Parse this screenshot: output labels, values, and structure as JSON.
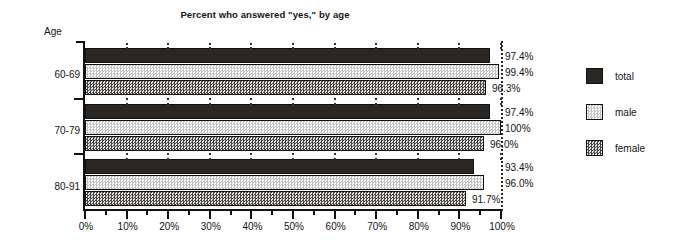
{
  "chart_data": {
    "type": "bar",
    "orientation": "horizontal",
    "title": "Percent who answered \"yes,\" by age",
    "xlabel": "",
    "ylabel": "Age",
    "xlim": [
      0,
      100
    ],
    "grid": true,
    "legend_position": "right",
    "categories": [
      "60-69",
      "70-79",
      "80-91"
    ],
    "series": [
      {
        "name": "total",
        "values": [
          97.4,
          97.4,
          93.4
        ],
        "labels": [
          "97.4%",
          "97.4%",
          "93.4%"
        ],
        "swatch": "solid-dark"
      },
      {
        "name": "male",
        "values": [
          99.4,
          100.0,
          96.0
        ],
        "labels": [
          "99.4%",
          "100%",
          "96.0%"
        ],
        "swatch": "light-checker"
      },
      {
        "name": "female",
        "values": [
          96.3,
          96.0,
          91.7
        ],
        "labels": [
          "96.3%",
          "96.0%",
          "91.7%"
        ],
        "swatch": "dark-checker"
      }
    ],
    "x_ticks_major": [
      0,
      10,
      20,
      30,
      40,
      50,
      60,
      70,
      80,
      90,
      100
    ],
    "x_tick_labels": [
      "0%",
      "10%",
      "20%",
      "30%",
      "40%",
      "50%",
      "60%",
      "70%",
      "80%",
      "90%",
      "100%"
    ],
    "x_ticks_minor": [
      5,
      15,
      25,
      35,
      45,
      55,
      65,
      75,
      85,
      95
    ],
    "reference_line": 100
  },
  "legend": {
    "items": [
      {
        "label": "total"
      },
      {
        "label": "male"
      },
      {
        "label": "female"
      }
    ]
  },
  "colors": {
    "total": "#2b2622",
    "male": "#dedede",
    "female": "#9a9a9a",
    "axis": "#111111",
    "text": "#151515",
    "background": "#ffffff"
  }
}
